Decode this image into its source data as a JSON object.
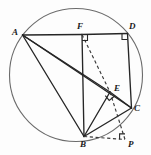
{
  "figure": {
    "canvas": {
      "width": 151,
      "height": 155
    },
    "background_color": "#fdfdfd",
    "stroke_color": "#2a2a2a",
    "circle_color": "#555555",
    "circle": {
      "cx": 76,
      "cy": 75,
      "r": 66.5,
      "label": "circumscribed-circle"
    },
    "points": [
      {
        "id": "A",
        "label": "A",
        "x": 22.5,
        "y": 35.0,
        "label_x": 12,
        "label_y": 28
      },
      {
        "id": "F",
        "label": "F",
        "x": 82.0,
        "y": 34.5,
        "label_x": 77,
        "label_y": 22
      },
      {
        "id": "D",
        "label": "D",
        "x": 127.5,
        "y": 33.5,
        "label_x": 129,
        "label_y": 22
      },
      {
        "id": "E",
        "label": "E",
        "x": 110.0,
        "y": 92.0,
        "label_x": 114,
        "label_y": 84
      },
      {
        "id": "C",
        "label": "C",
        "x": 131.5,
        "y": 108.0,
        "label_x": 134,
        "label_y": 104
      },
      {
        "id": "B",
        "label": "B",
        "x": 84.0,
        "y": 136.5,
        "label_x": 80,
        "label_y": 140
      },
      {
        "id": "P",
        "label": "P",
        "x": 125.0,
        "y": 139.5,
        "label_x": 128,
        "label_y": 140
      }
    ],
    "solid_segments": [
      {
        "name": "segment-AF",
        "from": "A",
        "to": "F"
      },
      {
        "name": "segment-FD",
        "from": "F",
        "to": "D"
      },
      {
        "name": "segment-AB",
        "from": "A",
        "to": "B"
      },
      {
        "name": "segment-AE",
        "from": "A",
        "to": "E"
      },
      {
        "name": "segment-AC",
        "from": "A",
        "to": "C"
      },
      {
        "name": "segment-FB",
        "from": "F",
        "to": "B"
      },
      {
        "name": "segment-DC",
        "from": "D",
        "to": "C"
      },
      {
        "name": "segment-BE",
        "from": "B",
        "to": "E"
      },
      {
        "name": "segment-BC",
        "from": "B",
        "to": "C"
      },
      {
        "name": "segment-EC",
        "from": "E",
        "to": "C"
      }
    ],
    "dashed_segments": [
      {
        "name": "segment-FE",
        "from": "F",
        "to": "E"
      },
      {
        "name": "segment-EP",
        "from": "E",
        "to": "P"
      },
      {
        "name": "segment-BP",
        "from": "B",
        "to": "P"
      }
    ],
    "right_angle_marks": [
      {
        "name": "right-angle-at-F",
        "vertex": "F",
        "size": 5.5,
        "dir_x": 1,
        "dir_y": 1
      },
      {
        "name": "right-angle-at-D",
        "vertex": "D",
        "size": 5.5,
        "dir_x": -1,
        "dir_y": 1
      },
      {
        "name": "right-angle-at-E",
        "vertex": "E",
        "size": 5.5,
        "rotation": -42
      },
      {
        "name": "right-angle-at-P",
        "vertex": "P",
        "size": 5.5,
        "dir_x": -1,
        "dir_y": -1
      }
    ],
    "arc": {
      "name": "arc-B-to-C",
      "description": "minor arc of circle from B to C"
    }
  }
}
